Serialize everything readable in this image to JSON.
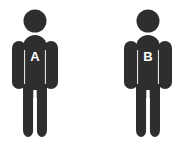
{
  "scene": {
    "title": "Two person pictograms labeled A and B",
    "background_color": "#ffffff",
    "figure_color": "#2e2e2e",
    "label_color": "#ffffff",
    "seam_color": "#f2f2f2",
    "width": 180,
    "height": 151
  },
  "figures": [
    {
      "id": "figure-a",
      "label": "A",
      "position": "left",
      "head_cx": 35,
      "head_cy": 21,
      "head_r": 11.5,
      "body_left": 12,
      "body_right": 58,
      "body_top": 35,
      "body_bottom": 137,
      "label_x": 35,
      "label_y": 58
    },
    {
      "id": "figure-b",
      "label": "B",
      "position": "right",
      "head_cx": 148,
      "head_cy": 21,
      "head_r": 11.5,
      "body_left": 124,
      "body_right": 172,
      "body_top": 35,
      "body_bottom": 137,
      "label_x": 148,
      "label_y": 58
    }
  ]
}
